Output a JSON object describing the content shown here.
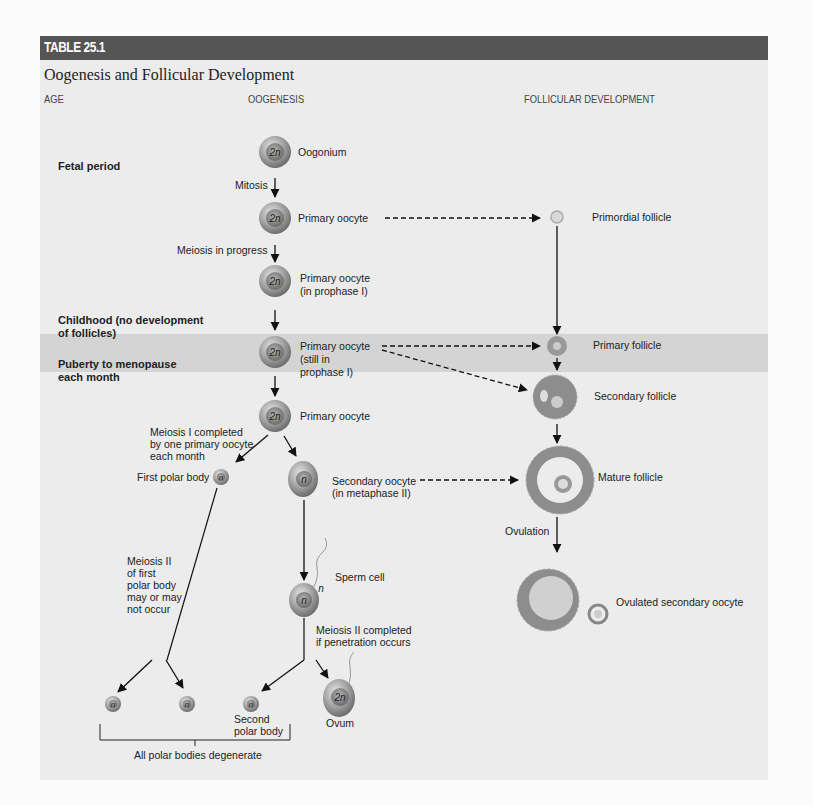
{
  "table": {
    "number": "TABLE 25.1",
    "title": "Oogenesis and Follicular Development",
    "columns": [
      "AGE",
      "OOGENESIS",
      "FOLLICULAR DEVELOPMENT"
    ]
  },
  "ages": {
    "fetal": "Fetal period",
    "childhood_1": "Childhood (no development",
    "childhood_2": "of follicles)",
    "puberty_1": "Puberty to menopause",
    "puberty_2": "each month"
  },
  "oogenesis": {
    "oogonium": "Oogonium",
    "oogonium_ploidy": "2n",
    "mitosis": "Mitosis",
    "primary_oocyte_1": "Primary oocyte",
    "meiosis_in_progress": "Meiosis in progress",
    "primary_oocyte_prophase_1": "Primary oocyte",
    "primary_oocyte_prophase_2": "(in prophase I)",
    "primary_oocyte_still_1": "Primary oocyte",
    "primary_oocyte_still_2": "(still in",
    "primary_oocyte_still_3": "prophase I)",
    "primary_oocyte_2": "Primary oocyte",
    "meiosis1_1": "Meiosis I completed",
    "meiosis1_2": "by one primary oocyte",
    "meiosis1_3": "each month",
    "first_polar_body": "First polar body",
    "secondary_oocyte_1": "Secondary oocyte",
    "secondary_oocyte_2": "(in metaphase II)",
    "meiosis2_pb_1": "Meiosis II",
    "meiosis2_pb_2": "of first",
    "meiosis2_pb_3": "polar body",
    "meiosis2_pb_4": "may or may",
    "meiosis2_pb_5": "not occur",
    "sperm_cell": "Sperm cell",
    "meiosis2_done_1": "Meiosis II completed",
    "meiosis2_done_2": "if penetration occurs",
    "second_polar_body_1": "Second",
    "second_polar_body_2": "polar body",
    "ovum": "Ovum",
    "degenerate": "All polar bodies degenerate",
    "diploid": "2n",
    "haploid": "n"
  },
  "follicular": {
    "primordial": "Primordial follicle",
    "primary": "Primary follicle",
    "secondary": "Secondary follicle",
    "mature": "Mature follicle",
    "ovulation": "Ovulation",
    "ovulated": "Ovulated secondary oocyte"
  },
  "colors": {
    "header_bar": "#555555",
    "panel": "#ececec",
    "band": "#d4d4d4",
    "cell": "#8a8a8a"
  }
}
